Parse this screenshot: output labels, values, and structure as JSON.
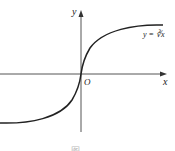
{
  "figure": {
    "function_label": "y = ∛x",
    "x_axis_label": "x",
    "y_axis_label": "y",
    "origin_label": "O",
    "caption": "图"
  },
  "colors": {
    "curve": "#222222",
    "axes": "#444444",
    "background": "#ffffff"
  }
}
